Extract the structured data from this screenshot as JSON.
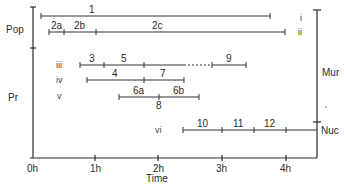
{
  "diagram": {
    "left_axis": {
      "groups": [
        {
          "label": "Pop",
          "y_from": 8,
          "y_to": 48
        },
        {
          "label": "Pr",
          "y_from": 48,
          "y_to": 146
        }
      ]
    },
    "right_axis": {
      "groups": [
        {
          "label": "Mur",
          "y_from": 10,
          "y_to": 122
        },
        {
          "label": "Nuc",
          "y_from": 122,
          "y_to": 158
        }
      ]
    },
    "x_axis": {
      "title": "Time",
      "ticks": [
        "0h",
        "1h",
        "2h",
        "3h",
        "4h"
      ]
    },
    "rows": [
      {
        "roman": "i",
        "segments": [
          {
            "label": "1",
            "from": 0.05,
            "to": 3.75
          }
        ]
      },
      {
        "roman": "ii",
        "segments": [
          {
            "label": "2a",
            "from": 0.15,
            "to": 0.5
          },
          {
            "label": "2b",
            "from": 0.5,
            "to": 1.0
          },
          {
            "label": "2c",
            "from": 1.0,
            "to": 4.0
          }
        ]
      },
      {
        "roman": "iii",
        "segments": [
          {
            "label": "3",
            "from": 0.8,
            "to": 1.2
          },
          {
            "label": "5",
            "from": 1.2,
            "to": 1.8
          },
          {
            "label": "",
            "from": 1.8,
            "to": 2.3,
            "dashed": true
          },
          {
            "label": "9",
            "from": 2.3,
            "to": 2.8
          }
        ]
      },
      {
        "roman": "iv",
        "segments": [
          {
            "label": "4",
            "from": 0.9,
            "to": 1.8
          },
          {
            "label": "7",
            "from": 1.8,
            "to": 2.4
          }
        ]
      },
      {
        "roman": "v",
        "segments": [
          {
            "label": "6a",
            "from": 1.4,
            "to": 2.0
          },
          {
            "label": "6b",
            "from": 2.0,
            "to": 2.65
          }
        ],
        "below_label": "8"
      },
      {
        "roman": "vi",
        "segments": [
          {
            "label": "10",
            "from": 2.4,
            "to": 3.0
          },
          {
            "label": "11",
            "from": 3.0,
            "to": 3.5
          },
          {
            "label": "12",
            "from": 3.5,
            "to": 4.0
          }
        ]
      }
    ]
  }
}
